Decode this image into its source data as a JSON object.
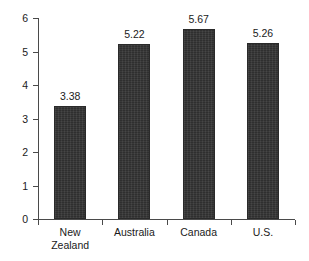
{
  "chart_data": {
    "type": "bar",
    "title": "",
    "subtitle": "",
    "xlabel": "",
    "ylabel": "",
    "categories": [
      "New Zealand",
      "Australia",
      "Canada",
      "U.S."
    ],
    "category_lines": [
      [
        "New",
        "Zealand"
      ],
      [
        "Australia"
      ],
      [
        "Canada"
      ],
      [
        "U.S."
      ]
    ],
    "values": [
      3.38,
      5.22,
      5.67,
      5.26
    ],
    "value_labels": [
      "3.38",
      "5.22",
      "5.67",
      "5.26"
    ],
    "ylim": [
      0,
      6
    ],
    "y_ticks": [
      0,
      1,
      2,
      3,
      4,
      5,
      6
    ],
    "y_tick_labels": [
      "0",
      "1",
      "2",
      "3",
      "4",
      "5",
      "6"
    ],
    "grid": false,
    "legend": false,
    "legend_position": "none",
    "bar_color": "#343434",
    "axis_color": "#4a4a4a",
    "text_color": "#1a1a1a",
    "background_color": "#ffffff",
    "data_labels_shown": true,
    "orientation": "vertical"
  }
}
